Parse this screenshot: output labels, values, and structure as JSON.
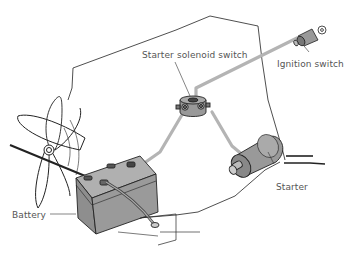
{
  "diagram": {
    "labels": {
      "starter_solenoid_switch": "Starter solenoid switch",
      "ignition_switch": "Ignition switch",
      "starter": "Starter",
      "battery": "Battery"
    },
    "colors": {
      "wire": "#b4b4b4",
      "component_fill": "#9a9a9a",
      "component_dark": "#7a7a7a",
      "outline": "#222222",
      "label_text": "#555555"
    },
    "components": [
      "fan",
      "battery",
      "starter-solenoid-switch",
      "starter",
      "ignition-switch",
      "engine-bay-outline"
    ]
  }
}
